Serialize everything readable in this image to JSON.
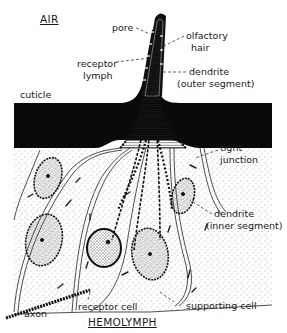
{
  "diagram": {
    "regions": {
      "top": "AIR",
      "bottom": "HEMOLYMPH"
    },
    "labels": {
      "pore": "pore",
      "olfactory_hair_1": "olfactory",
      "olfactory_hair_2": "hair",
      "receptor_lymph_1": "receptor",
      "receptor_lymph_2": "lymph",
      "dendrite_outer_1": "dendrite",
      "dendrite_outer_2": "(outer segment)",
      "cuticle": "cuticle",
      "tight_junction_1": "tight",
      "tight_junction_2": "junction",
      "dendrite_inner_1": "dendrite",
      "dendrite_inner_2": "(inner segment)",
      "axon": "axon",
      "receptor_cell": "receptor cell",
      "supporting_cell": "supporting cell"
    },
    "colors": {
      "ink": "#111111",
      "paper": "#ffffff",
      "cuticle": "#0a0a0a",
      "stipple": "#555555"
    }
  }
}
